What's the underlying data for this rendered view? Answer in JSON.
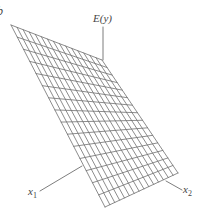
{
  "figure": {
    "panel_mark": "b",
    "axes": {
      "y_label": "E(y)",
      "x1_label": "x",
      "x1_sub": "1",
      "x2_label": "x",
      "x2_sub": "2"
    },
    "surface": {
      "description": "Planar regression surface E(y) over x1, x2 drawn as a wireframe grid",
      "corners": {
        "top_left": [
          11,
          25
        ],
        "top_right": [
          102,
          60
        ],
        "bottom_right": [
          178,
          173
        ],
        "bottom_left": [
          105,
          207
        ]
      },
      "grid_divisions_u": 15,
      "grid_divisions_v": 15
    },
    "axis_lines": {
      "y_axis": [
        [
          103,
          27
        ],
        [
          103,
          60
        ]
      ],
      "x1_axis": [
        [
          40,
          191
        ],
        [
          82,
          166
        ]
      ],
      "x2_axis": [
        [
          166,
          181
        ],
        [
          182,
          190
        ]
      ]
    },
    "colors": {
      "line": "#6e6e6e",
      "text": "#444444",
      "background": "#ffffff"
    }
  }
}
